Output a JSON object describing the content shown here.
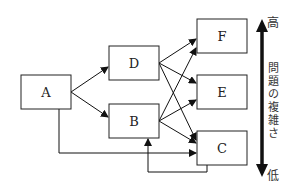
{
  "diagram": {
    "nodes": [
      {
        "id": "A",
        "label": "A",
        "x": 21,
        "y": 75,
        "w": 50,
        "h": 34
      },
      {
        "id": "D",
        "label": "D",
        "x": 109,
        "y": 46,
        "w": 50,
        "h": 34
      },
      {
        "id": "B",
        "label": "B",
        "x": 109,
        "y": 104,
        "w": 50,
        "h": 34
      },
      {
        "id": "F",
        "label": "F",
        "x": 197,
        "y": 19,
        "w": 50,
        "h": 34
      },
      {
        "id": "E",
        "label": "E",
        "x": 197,
        "y": 75,
        "w": 50,
        "h": 34
      },
      {
        "id": "C",
        "label": "C",
        "x": 197,
        "y": 131,
        "w": 50,
        "h": 34
      }
    ],
    "edges": [
      {
        "from": "A",
        "to": "D"
      },
      {
        "from": "A",
        "to": "B"
      },
      {
        "from": "D",
        "to": "F"
      },
      {
        "from": "D",
        "to": "E"
      },
      {
        "from": "D",
        "to": "C"
      },
      {
        "from": "B",
        "to": "F"
      },
      {
        "from": "B",
        "to": "E"
      },
      {
        "from": "B",
        "to": "C"
      },
      {
        "from": "A",
        "to": "C",
        "route": "below"
      },
      {
        "from": "C",
        "to": "B",
        "route": "below"
      }
    ],
    "axis": {
      "high_label": "高",
      "low_label": "低",
      "title": "問題の複雑さ",
      "title_chars": [
        "問",
        "題",
        "の",
        "複",
        "雑",
        "さ"
      ]
    }
  }
}
